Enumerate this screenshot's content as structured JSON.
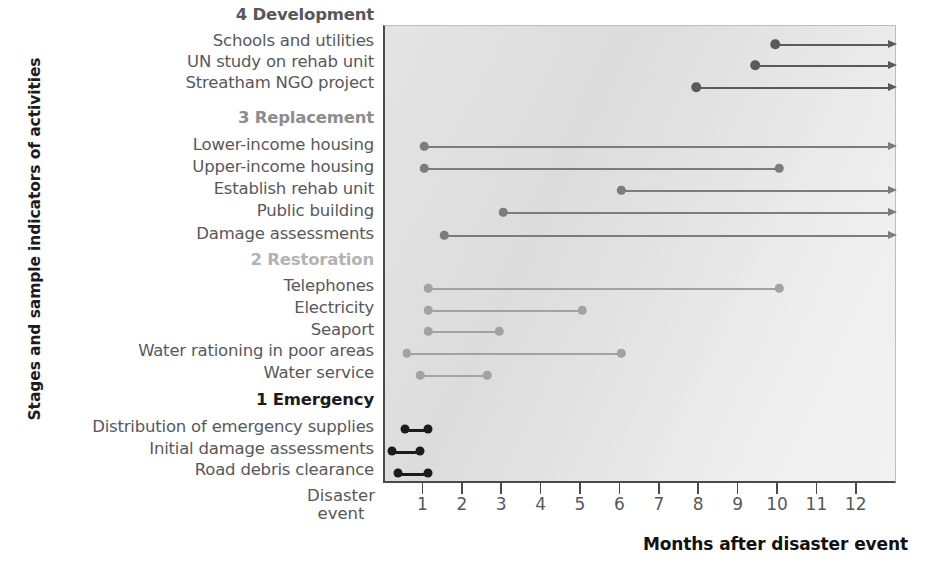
{
  "chart_data": {
    "type": "bar",
    "title": "",
    "xlabel": "Months after disaster event",
    "ylabel": "Stages and sample indicators of activities",
    "origin_label_line1": "Disaster",
    "origin_label_line2": "event",
    "xlim": [
      0,
      12
    ],
    "xticks": [
      1,
      2,
      3,
      4,
      5,
      6,
      7,
      8,
      9,
      10,
      11,
      12
    ],
    "xtick_labels": [
      "1",
      "2",
      "3",
      "4",
      "5",
      "6",
      "7",
      "8",
      "9",
      "10",
      "11",
      "12"
    ],
    "grid": false,
    "legend": "none",
    "note": "Horizontal Gantt-style timeline; each activity is a bar from its start month to its end month. Bars terminating with an arrowhead continue beyond month 12.",
    "stages": [
      {
        "number": "4",
        "name": "Development",
        "label": "4 Development",
        "color": "#58585a",
        "bar_color": "#5a5a5c",
        "activities": [
          {
            "label": "Schools and utilities",
            "start": 9.9,
            "end": 12,
            "open_ended": true,
            "row": 0
          },
          {
            "label": "UN study on rehab unit",
            "start": 9.4,
            "end": 12,
            "open_ended": true,
            "row": 1
          },
          {
            "label": "Streatham NGO project",
            "start": 7.9,
            "end": 12,
            "open_ended": true,
            "row": 2
          }
        ]
      },
      {
        "number": "3",
        "name": "Replacement",
        "label": "3 Replacement",
        "color": "#8d8d8f",
        "bar_color": "#7c7c7e",
        "activities": [
          {
            "label": "Lower-income housing",
            "start": 1.0,
            "end": 12,
            "open_ended": true,
            "row": 3
          },
          {
            "label": "Upper-income housing",
            "start": 1.0,
            "end": 10.0,
            "open_ended": false,
            "row": 4
          },
          {
            "label": "Establish rehab unit",
            "start": 6.0,
            "end": 12,
            "open_ended": true,
            "row": 5
          },
          {
            "label": "Public building",
            "start": 3.0,
            "end": 12,
            "open_ended": true,
            "row": 6
          },
          {
            "label": "Damage assessments",
            "start": 1.5,
            "end": 12,
            "open_ended": true,
            "row": 7
          }
        ]
      },
      {
        "number": "2",
        "name": "Restoration",
        "label": "2 Restoration",
        "color": "#b3b3b5",
        "bar_color": "#a2a2a4",
        "activities": [
          {
            "label": "Telephones",
            "start": 1.1,
            "end": 10.0,
            "open_ended": false,
            "row": 8
          },
          {
            "label": "Electricity",
            "start": 1.1,
            "end": 5.0,
            "open_ended": false,
            "row": 9
          },
          {
            "label": "Seaport",
            "start": 1.1,
            "end": 2.9,
            "open_ended": false,
            "row": 10
          },
          {
            "label": "Water rationing in poor areas",
            "start": 0.55,
            "end": 6.0,
            "open_ended": false,
            "row": 11
          },
          {
            "label": "Water service",
            "start": 0.9,
            "end": 2.6,
            "open_ended": false,
            "row": 12
          }
        ]
      },
      {
        "number": "1",
        "name": "Emergency",
        "label": "1 Emergency",
        "color": "#1c1c1c",
        "bar_color": "#1c1c1c",
        "activities": [
          {
            "label": "Distribution of emergency supplies",
            "start": 0.52,
            "end": 1.08,
            "open_ended": false,
            "row": 13
          },
          {
            "label": "Initial damage assessments",
            "start": 0.18,
            "end": 0.9,
            "open_ended": false,
            "row": 14
          },
          {
            "label": "Road debris clearance",
            "start": 0.33,
            "end": 1.08,
            "open_ended": false,
            "row": 15
          }
        ]
      }
    ]
  },
  "rows": [
    {
      "kind": "stage",
      "text": "4 Development",
      "stage": 0,
      "y": 7
    },
    {
      "kind": "activity",
      "text": "Schools and utilities",
      "stage": 0,
      "y": 33
    },
    {
      "kind": "activity",
      "text": "UN study on rehab unit",
      "stage": 0,
      "y": 54
    },
    {
      "kind": "activity",
      "text": "Streatham NGO project",
      "stage": 0,
      "y": 75
    },
    {
      "kind": "stage",
      "text": "3 Replacement",
      "stage": 1,
      "y": 110
    },
    {
      "kind": "activity",
      "text": "Lower-income housing",
      "stage": 1,
      "y": 137
    },
    {
      "kind": "activity",
      "text": "Upper-income housing",
      "stage": 1,
      "y": 159
    },
    {
      "kind": "activity",
      "text": "Establish rehab unit",
      "stage": 1,
      "y": 181
    },
    {
      "kind": "activity",
      "text": "Public building",
      "stage": 1,
      "y": 203
    },
    {
      "kind": "activity",
      "text": "Damage assessments",
      "stage": 1,
      "y": 226
    },
    {
      "kind": "stage",
      "text": "2 Restoration",
      "stage": 2,
      "y": 252
    },
    {
      "kind": "activity",
      "text": "Telephones",
      "stage": 2,
      "y": 278
    },
    {
      "kind": "activity",
      "text": "Electricity",
      "stage": 2,
      "y": 300
    },
    {
      "kind": "activity",
      "text": "Seaport",
      "stage": 2,
      "y": 322
    },
    {
      "kind": "activity",
      "text": "Water rationing in poor areas",
      "stage": 2,
      "y": 343
    },
    {
      "kind": "activity",
      "text": "Water service",
      "stage": 2,
      "y": 365
    },
    {
      "kind": "stage",
      "text": "1 Emergency",
      "stage": 3,
      "y": 392
    },
    {
      "kind": "activity",
      "text": "Distribution of emergency supplies",
      "stage": 3,
      "y": 419
    },
    {
      "kind": "activity",
      "text": "Initial damage assessments",
      "stage": 3,
      "y": 441
    },
    {
      "kind": "activity",
      "text": "Road debris clearance",
      "stage": 3,
      "y": 462
    }
  ],
  "bar_rows_y": [
    18,
    39,
    61,
    120,
    142,
    164,
    186,
    209,
    262,
    284,
    305,
    327,
    349,
    403,
    425,
    447
  ]
}
